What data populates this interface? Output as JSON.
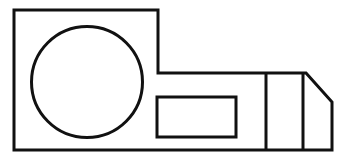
{
  "canvas": {
    "width": 345,
    "height": 164,
    "background_color": "#ffffff",
    "title": "technical-line-drawing"
  },
  "style": {
    "line_color": "#111111",
    "line_width": 3,
    "fill_color": "none",
    "linejoin": "miter",
    "linecap": "butt"
  },
  "drawing": {
    "type": "2d-technical-part-outline",
    "shapes": [
      {
        "name": "outer-profile",
        "kind": "polygon",
        "closed": true,
        "points": "14,10 158,10 158,73 306,73 332,102 332,150 14,150",
        "description": "stepped outer boundary with chamfered upper-right corner"
      },
      {
        "name": "center-hole-circle",
        "kind": "circle",
        "cx": 87,
        "cy": 82,
        "r": 55.5,
        "description": "large circular hole in left block"
      },
      {
        "name": "rectangular-slot",
        "kind": "rect",
        "x": 157,
        "y": 97,
        "width": 79,
        "height": 40,
        "description": "small rectangular slot in lower middle"
      },
      {
        "name": "divider-line-left",
        "kind": "line",
        "x1": 266,
        "y1": 73,
        "x2": 266,
        "y2": 150,
        "description": "vertical division line on right tab"
      },
      {
        "name": "divider-line-right",
        "kind": "line",
        "x1": 303,
        "y1": 73,
        "x2": 303,
        "y2": 150,
        "description": "second vertical division line before chamfer"
      }
    ]
  }
}
